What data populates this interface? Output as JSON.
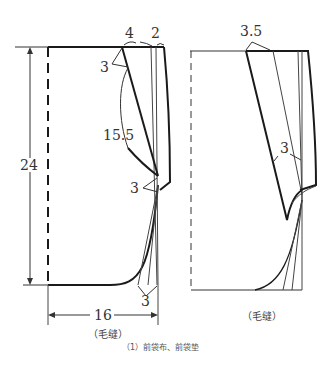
{
  "figure": {
    "caption": "（1）前袋布、前袋垫",
    "left_piece": {
      "note": "（毛缝）",
      "dimensions": {
        "height": "24",
        "width": "16",
        "top_offset_a": "4",
        "top_offset_b": "2",
        "dart_top": "3",
        "curve_length": "15.5",
        "side_point": "3",
        "bottom_point": "3"
      }
    },
    "right_piece": {
      "note": "（毛缝）",
      "dimensions": {
        "top_offset": "3.5",
        "side_point": "3"
      }
    },
    "colors": {
      "line": "#1a1a1a",
      "thin_line": "#444444",
      "text": "#333333"
    }
  }
}
